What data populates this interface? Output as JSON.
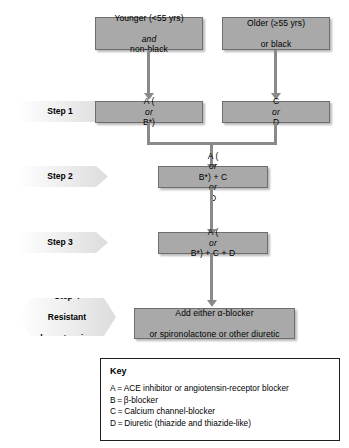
{
  "diagram": {
    "colors": {
      "box_fill": "#a9a9a9",
      "box_border": "#6e6e6e",
      "connector": "#8a8a8a",
      "banner_fill": "#dcdcdc",
      "key_border": "#231f20",
      "text": "#000000"
    }
  },
  "top_boxes": [
    {
      "id": "younger-non-black",
      "line1": "Younger (<55 yrs)",
      "line2_italic": "and",
      "line2_rest": " non-black"
    },
    {
      "id": "older-or-black",
      "line1": "Older (≥55 yrs)",
      "line2": "or black"
    }
  ],
  "steps": [
    {
      "id": "step-1",
      "label_lines": [
        "Step 1"
      ],
      "boxes": [
        {
          "id": "step1-left",
          "pre": "A (",
          "italic": "or",
          "post": " B*)"
        },
        {
          "id": "step1-right",
          "pre": "C ",
          "italic": "or",
          "post": " D"
        }
      ]
    },
    {
      "id": "step-2",
      "label_lines": [
        "Step 2"
      ],
      "boxes": [
        {
          "id": "step2-main",
          "pre": "A (",
          "italic": "or",
          "post": " B*) + C ",
          "italic2": "or",
          "post2": " D"
        }
      ]
    },
    {
      "id": "step-3",
      "label_lines": [
        "Step 3"
      ],
      "boxes": [
        {
          "id": "step3-main",
          "pre": "A (",
          "italic": "or",
          "post": " B*) + C + D"
        }
      ]
    },
    {
      "id": "step-4",
      "label_lines": [
        "Step 4",
        "Resistant",
        "hypertension"
      ],
      "boxes": [
        {
          "id": "step4-main",
          "line1": "Add either α-blocker",
          "line2": "or spironolactone or other diuretic"
        }
      ]
    }
  ],
  "key": {
    "title": "Key",
    "entries": [
      "A = ACE inhibitor or angiotensin-receptor blocker",
      "B = β-blocker",
      "C = Calcium channel-blocker",
      "D = Diuretic (thiazide and thiazide-like)"
    ]
  }
}
